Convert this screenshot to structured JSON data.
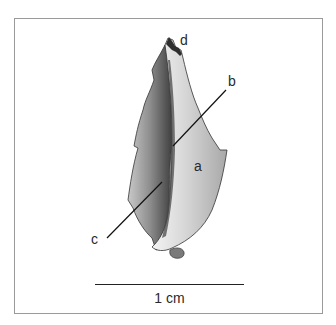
{
  "figure": {
    "labels": [
      {
        "id": "a",
        "text": "a"
      },
      {
        "id": "b",
        "text": "b"
      },
      {
        "id": "c",
        "text": "c"
      },
      {
        "id": "d",
        "text": "d"
      }
    ],
    "scale_bar": {
      "text": "1 cm"
    },
    "colors": {
      "frame_border": "#9a9a9a",
      "bone_light": "#e8e8e8",
      "bone_mid": "#b5b5b5",
      "bone_dark": "#5a5a5a",
      "leader_line": "#111111"
    }
  }
}
